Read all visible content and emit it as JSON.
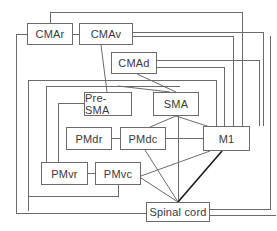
{
  "diagram": {
    "title": "",
    "line_color": "#6b6b6b",
    "strong_line_color": "#1a1a1a",
    "nodes": [
      {
        "id": "CMAr",
        "label": "CMAr",
        "x": 27,
        "y": 23,
        "w": 46,
        "h": 22
      },
      {
        "id": "CMAv",
        "label": "CMAv",
        "x": 79,
        "y": 23,
        "w": 54,
        "h": 22
      },
      {
        "id": "CMAd",
        "label": "CMAd",
        "x": 111,
        "y": 52,
        "w": 46,
        "h": 22
      },
      {
        "id": "PreSMA",
        "label": "Pre-SMA",
        "x": 84,
        "y": 92,
        "w": 48,
        "h": 24
      },
      {
        "id": "SMA",
        "label": "SMA",
        "x": 153,
        "y": 92,
        "w": 46,
        "h": 24
      },
      {
        "id": "PMdr",
        "label": "PMdr",
        "x": 66,
        "y": 127,
        "w": 46,
        "h": 23
      },
      {
        "id": "PMdc",
        "label": "PMdc",
        "x": 120,
        "y": 127,
        "w": 46,
        "h": 23
      },
      {
        "id": "M1",
        "label": "M1",
        "x": 203,
        "y": 126,
        "w": 47,
        "h": 25
      },
      {
        "id": "PMvr",
        "label": "PMvr",
        "x": 41,
        "y": 162,
        "w": 47,
        "h": 23
      },
      {
        "id": "PMvc",
        "label": "PMvc",
        "x": 95,
        "y": 162,
        "w": 46,
        "h": 23
      },
      {
        "id": "SpinalCord",
        "label": "Spinal cord",
        "x": 146,
        "y": 202,
        "w": 64,
        "h": 20
      }
    ],
    "edges": [
      {
        "from": "CMAr",
        "to": "CMAv"
      },
      {
        "from": "PMdr",
        "to": "PMdc"
      },
      {
        "from": "PMvr",
        "to": "PMvc"
      },
      {
        "from": "PMdc",
        "to": "M1"
      },
      {
        "from": "CMAv",
        "to": "PreSMA"
      },
      {
        "from": "CMAd",
        "to": "SMA"
      },
      {
        "from": "SMA",
        "to": "PMdc"
      },
      {
        "from": "SMA",
        "to": "M1"
      },
      {
        "from": "SMA",
        "to": "SpinalCord"
      },
      {
        "from": "PMdc",
        "to": "SpinalCord"
      },
      {
        "from": "PMvc",
        "to": "SpinalCord"
      },
      {
        "from": "PMvc",
        "to": "M1"
      },
      {
        "from": "M1",
        "to": "SpinalCord",
        "emphasis": true
      },
      {
        "from": "CMAr",
        "to": "M1"
      },
      {
        "from": "CMAv",
        "to": "M1"
      },
      {
        "from": "CMAd",
        "to": "M1"
      },
      {
        "from": "CMAr",
        "to": "SpinalCord"
      },
      {
        "from": "CMAv",
        "to": "SpinalCord"
      },
      {
        "from": "PMvc",
        "to": "CMA"
      },
      {
        "from": "PreSMA",
        "to": "PMvr"
      },
      {
        "from": "PreSMA",
        "to": "SMA"
      }
    ]
  }
}
